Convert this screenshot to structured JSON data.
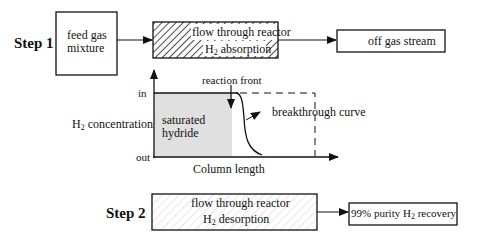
{
  "step1": {
    "label": "Step  1",
    "feed_box": {
      "line1": "feed gas",
      "line2": "mixture"
    },
    "reactor_box": {
      "line1": "flow through reactor",
      "h2_prefix": "H",
      "h2_sub": "2",
      "line2_rest": " absorption"
    },
    "output_box": {
      "label": "off gas stream"
    }
  },
  "plot": {
    "y_axis_label_prefix": "H",
    "y_axis_label_sub": "2",
    "y_axis_label_rest": " concentration",
    "y_tick_top": "in",
    "y_tick_bottom": "out",
    "x_axis_label": "Column length",
    "region_label_line1": "saturated",
    "region_label_line2": "hydride",
    "reaction_front_label": "reaction front",
    "breakthrough_label": "breakthrough curve"
  },
  "step2": {
    "label": "Step  2",
    "reactor_box": {
      "line1": "flow through reactor",
      "h2_prefix": "H",
      "h2_sub": "2",
      "line2_rest": " desorption"
    },
    "output_box": {
      "prefix": "99% purity H",
      "sub": "2",
      "rest": " recovery"
    }
  },
  "colors": {
    "line": "#111111",
    "hatch_dark": "#222222",
    "hatch_light": "#d0d0d0",
    "saturated_fill": "#e0e0e0"
  }
}
